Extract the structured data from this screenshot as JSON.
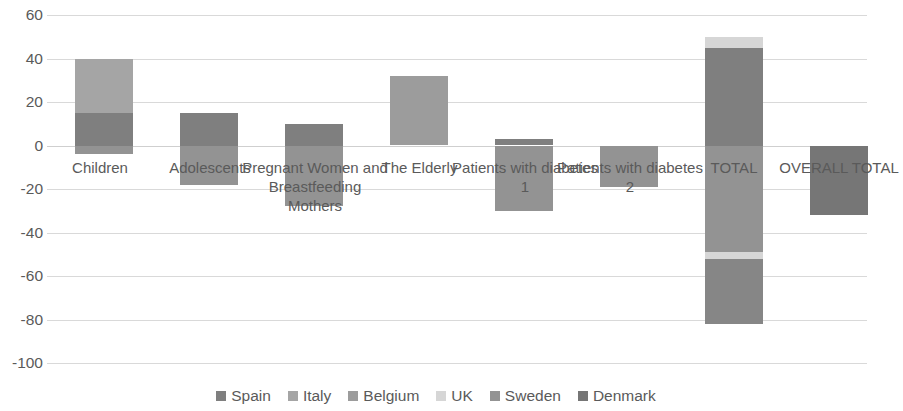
{
  "chart_data": {
    "type": "bar",
    "subtype": "stacked-bar",
    "title": "",
    "xlabel": "",
    "ylabel": "",
    "ylim": [
      -100,
      60
    ],
    "yticks": [
      60,
      40,
      20,
      0,
      -20,
      -40,
      -60,
      -80,
      -100
    ],
    "ytick_labels": [
      "60",
      "40",
      "20",
      "0",
      "-20",
      "-40",
      "-60",
      "-80",
      "-100"
    ],
    "grid": true,
    "legend_position": "bottom",
    "categories": [
      "Children",
      "Adolescents",
      "Pregnant Women and Breastfeeding Mothers",
      "The Elderly",
      "Patients with diabetes 1",
      "Patients with diabetes 2",
      "TOTAL",
      "OVERALL TOTAL"
    ],
    "series": [
      {
        "name": "Spain",
        "color": "#7f7f7f",
        "values": [
          0,
          15,
          10,
          0,
          3,
          0,
          45,
          0
        ]
      },
      {
        "name": "Italy",
        "color": "#a5a5a5",
        "values": [
          25,
          0,
          0,
          0,
          0,
          0,
          0,
          0
        ]
      },
      {
        "name": "Belgium",
        "color": "#9c9c9c",
        "values": [
          0,
          0,
          0,
          32,
          0,
          0,
          0,
          0
        ]
      },
      {
        "name": "UK",
        "color": "#d6d6d6",
        "values": [
          0,
          0,
          0,
          0,
          0,
          0,
          5,
          0
        ]
      },
      {
        "name": "Sweden",
        "color": "#939393",
        "values": [
          -4,
          -18,
          -28,
          0,
          -30,
          -19,
          -49,
          0
        ]
      },
      {
        "name": "Denmark",
        "color": "#767676",
        "values": [
          0,
          0,
          0,
          0,
          0,
          0,
          -30,
          -32
        ]
      }
    ],
    "legend": [
      {
        "label": "Spain",
        "color": "#7f7f7f"
      },
      {
        "label": "Italy",
        "color": "#a5a5a5"
      },
      {
        "label": "Belgium",
        "color": "#9c9c9c"
      },
      {
        "label": "UK",
        "color": "#d6d6d6"
      },
      {
        "label": "Sweden",
        "color": "#939393"
      },
      {
        "label": "Denmark",
        "color": "#767676"
      }
    ]
  },
  "axis": {
    "ticks": [
      {
        "label": "60"
      },
      {
        "label": "40"
      },
      {
        "label": "20"
      },
      {
        "label": "0"
      },
      {
        "label": "-20"
      },
      {
        "label": "-40"
      },
      {
        "label": "-60"
      },
      {
        "label": "-80"
      },
      {
        "label": "-100"
      }
    ]
  },
  "bars": [
    {
      "name": "children",
      "label": "Children",
      "x": 28,
      "width": 58,
      "label_top": 143,
      "label_left": -6,
      "label_width": 118,
      "segments": [
        {
          "series": "Italy",
          "color": "#a5a5a5",
          "from": 15,
          "to": 40
        },
        {
          "series": "Spain",
          "color": "#7f7f7f",
          "from": 0,
          "to": 15
        },
        {
          "series": "Sweden",
          "color": "#939393",
          "from": -4,
          "to": 0
        }
      ]
    },
    {
      "name": "adolescents",
      "label": "Adolescents",
      "x": 133,
      "width": 58,
      "label_top": 143,
      "label_left": 97,
      "label_width": 132,
      "segments": [
        {
          "series": "Spain",
          "color": "#7f7f7f",
          "from": 0,
          "to": 15
        },
        {
          "series": "Sweden",
          "color": "#939393",
          "from": -18,
          "to": 0
        }
      ]
    },
    {
      "name": "pregnant-women-and-breastfeeding-mothers",
      "label": "Pregnant Women and Breastfeeding Mothers",
      "x": 238,
      "width": 58,
      "label_top": 143,
      "label_left": 193,
      "label_width": 150,
      "segments": [
        {
          "series": "Spain",
          "color": "#7f7f7f",
          "from": 0,
          "to": 10
        },
        {
          "series": "Sweden",
          "color": "#939393",
          "from": -28,
          "to": 0
        }
      ]
    },
    {
      "name": "the-elderly",
      "label": "The Elderly",
      "x": 343,
      "width": 58,
      "label_top": 143,
      "label_left": 310,
      "label_width": 125,
      "segments": [
        {
          "series": "Belgium",
          "color": "#9c9c9c",
          "from": 0,
          "to": 32
        }
      ]
    },
    {
      "name": "patients-with-diabetes-1",
      "label": "Patients with diabetes 1",
      "x": 448,
      "width": 58,
      "label_top": 143,
      "label_left": 404,
      "label_width": 148,
      "segments": [
        {
          "series": "Spain",
          "color": "#7f7f7f",
          "from": 0,
          "to": 3
        },
        {
          "series": "Sweden",
          "color": "#939393",
          "from": -30,
          "to": 0
        }
      ]
    },
    {
      "name": "patients-with-diabetes-2",
      "label": "Patients with diabetes 2",
      "x": 553,
      "width": 58,
      "label_top": 143,
      "label_left": 509,
      "label_width": 148,
      "segments": [
        {
          "series": "Sweden",
          "color": "#939393",
          "from": -19,
          "to": 0
        }
      ]
    },
    {
      "name": "total",
      "label": "TOTAL",
      "x": 658,
      "width": 58,
      "label_top": 143,
      "label_left": 633,
      "label_width": 108,
      "segments": [
        {
          "series": "UK",
          "color": "#d6d6d6",
          "from": 45,
          "to": 50
        },
        {
          "series": "Spain",
          "color": "#7f7f7f",
          "from": 0,
          "to": 45
        },
        {
          "series": "Sweden",
          "color": "#939393",
          "from": -49,
          "to": 0
        },
        {
          "series": "UK",
          "color": "#d6d6d6",
          "from": -52,
          "to": -49
        },
        {
          "series": "Denmark",
          "color": "#868686",
          "from": -82,
          "to": -52
        }
      ]
    },
    {
      "name": "overall-total",
      "label": "OVERALL TOTAL",
      "x": 763,
      "width": 58,
      "label_top": 143,
      "label_left": 722,
      "label_width": 140,
      "segments": [
        {
          "series": "Denmark",
          "color": "#767676",
          "from": -32,
          "to": 0
        }
      ]
    }
  ]
}
